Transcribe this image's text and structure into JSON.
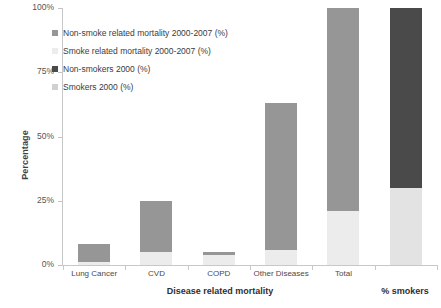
{
  "chart_data": {
    "type": "bar",
    "subtype": "stacked-bar",
    "title": "",
    "xlabel": "Disease related mortality",
    "xlabel_secondary": "% smokers",
    "ylabel": "Percentage",
    "ylim": [
      0,
      100
    ],
    "ytick_labels": [
      "0%",
      "25%",
      "50%",
      "75%",
      "100%"
    ],
    "ytick_values": [
      0,
      25,
      50,
      75,
      100
    ],
    "grid": false,
    "legend_position": "upper-left-inside",
    "categories": [
      "Lung Cancer",
      "CVD",
      "COPD",
      "Other Diseases",
      "Total",
      ""
    ],
    "series": [
      {
        "name": "Smokers 2000 (%)",
        "color": "#e3e3e3",
        "values": [
          null,
          null,
          null,
          null,
          null,
          30
        ]
      },
      {
        "name": "Non-smokers 2000 (%)",
        "color": "#4a4a4a",
        "values": [
          null,
          null,
          null,
          null,
          null,
          70
        ]
      },
      {
        "name": "Smoke related mortality 2000-2007 (%)",
        "color": "#ececec",
        "values": [
          1,
          5,
          4,
          6,
          21,
          null
        ]
      },
      {
        "name": "Non-smoke related mortality 2000-2007 (%)",
        "color": "#969696",
        "values": [
          7,
          20,
          1,
          57,
          79,
          null
        ]
      }
    ],
    "bars": [
      {
        "category": "Lung Cancer",
        "total": 8,
        "segments": [
          {
            "series": "Smoke related mortality 2000-2007 (%)",
            "value": 1,
            "color": "#ececec"
          },
          {
            "series": "Non-smoke related mortality 2000-2007 (%)",
            "value": 7,
            "color": "#969696"
          }
        ]
      },
      {
        "category": "CVD",
        "total": 25,
        "segments": [
          {
            "series": "Smoke related mortality 2000-2007 (%)",
            "value": 5,
            "color": "#ececec"
          },
          {
            "series": "Non-smoke related mortality 2000-2007 (%)",
            "value": 20,
            "color": "#969696"
          }
        ]
      },
      {
        "category": "COPD",
        "total": 5,
        "segments": [
          {
            "series": "Smoke related mortality 2000-2007 (%)",
            "value": 4,
            "color": "#ececec"
          },
          {
            "series": "Non-smoke related mortality 2000-2007 (%)",
            "value": 1,
            "color": "#969696"
          }
        ]
      },
      {
        "category": "Other Diseases",
        "total": 63,
        "segments": [
          {
            "series": "Smoke related mortality 2000-2007 (%)",
            "value": 6,
            "color": "#ececec"
          },
          {
            "series": "Non-smoke related mortality 2000-2007 (%)",
            "value": 57,
            "color": "#969696"
          }
        ]
      },
      {
        "category": "Total",
        "total": 100,
        "segments": [
          {
            "series": "Smoke related mortality 2000-2007 (%)",
            "value": 21,
            "color": "#ececec"
          },
          {
            "series": "Non-smoke related mortality 2000-2007 (%)",
            "value": 79,
            "color": "#969696"
          }
        ]
      },
      {
        "category": "% smokers",
        "total": 100,
        "segments": [
          {
            "series": "Smokers 2000 (%)",
            "value": 30,
            "color": "#e3e3e3"
          },
          {
            "series": "Non-smokers 2000 (%)",
            "value": 70,
            "color": "#4a4a4a"
          }
        ]
      }
    ]
  },
  "legend": {
    "items": [
      {
        "label": "Non-smoke related mortality 2000-2007 (%)",
        "color": "#969696"
      },
      {
        "label": "Smoke related mortality 2000-2007 (%)",
        "color": "#ececec"
      },
      {
        "label": "Non-smokers 2000 (%)",
        "color": "#4a4a4a"
      },
      {
        "label": "Smokers 2000 (%)",
        "color": "#d0d0d0"
      }
    ]
  },
  "axes": {
    "y_title": "Percentage",
    "y_ticks": [
      "100%",
      "75%",
      "50%",
      "25%",
      "0%"
    ],
    "x_ticks": [
      "Lung Cancer",
      "CVD",
      "COPD",
      "Other Diseases",
      "Total"
    ],
    "x_group_titles": [
      "Disease related mortality",
      "% smokers"
    ]
  }
}
